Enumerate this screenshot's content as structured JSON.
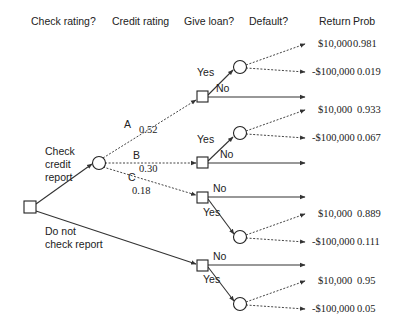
{
  "headers": {
    "check_rating": "Check rating?",
    "credit_rating": "Credit rating",
    "give_loan": "Give loan?",
    "default": "Default?",
    "return": "Return",
    "prob": "Prob"
  },
  "branches": {
    "check": "Check credit report",
    "check_lines": [
      "Check",
      "credit",
      "report"
    ],
    "nocheck_lines": [
      "Do not",
      "check report"
    ],
    "rating_A": "A",
    "rating_A_prob": "0.52",
    "rating_B": "B",
    "rating_B_prob": "0.30",
    "rating_C": "C",
    "rating_C_prob": "0.18",
    "yes": "Yes",
    "no": "No"
  },
  "outcomes": [
    {
      "return": "$10,000",
      "prob": "0.981"
    },
    {
      "return": "-$100,000",
      "prob": "0.019"
    },
    {
      "return": "$10,000",
      "prob": "0.933"
    },
    {
      "return": "-$100,000",
      "prob": "0.067"
    },
    {
      "return": "$10,000",
      "prob": "0.889"
    },
    {
      "return": "-$100,000",
      "prob": "0.111"
    },
    {
      "return": "$10,000",
      "prob": "0.95"
    },
    {
      "return": "-$100,000",
      "prob": "0.05"
    }
  ],
  "colors": {
    "line": "#333333",
    "background": "#ffffff"
  }
}
